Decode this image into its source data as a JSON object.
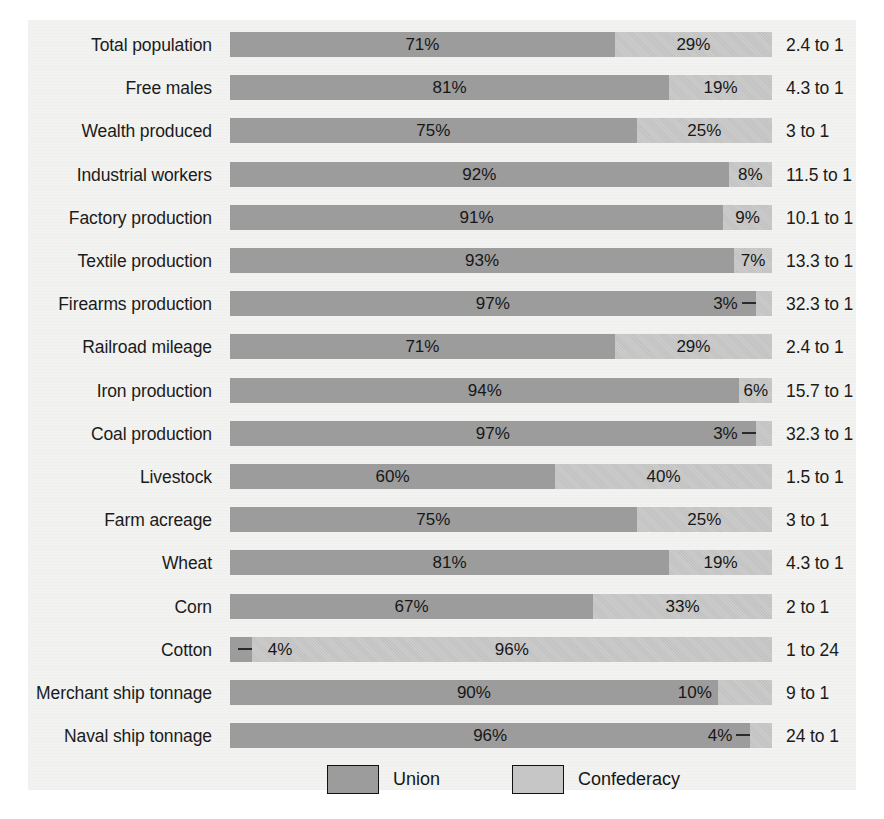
{
  "chart_data": {
    "type": "bar",
    "subtype": "stacked-horizontal-100pct",
    "title": "",
    "xlabel": "",
    "ylabel": "",
    "xlim": [
      0,
      100
    ],
    "grid": false,
    "legend_position": "bottom",
    "categories": [
      "Total population",
      "Free males",
      "Wealth produced",
      "Industrial workers",
      "Factory production",
      "Textile production",
      "Firearms production",
      "Railroad mileage",
      "Iron production",
      "Coal production",
      "Livestock",
      "Farm acreage",
      "Wheat",
      "Corn",
      "Cotton",
      "Merchant ship tonnage",
      "Naval ship tonnage"
    ],
    "series": [
      {
        "name": "Union",
        "color": "#9c9c9c",
        "values": [
          71,
          81,
          75,
          92,
          91,
          93,
          97,
          71,
          94,
          97,
          60,
          75,
          81,
          67,
          4,
          90,
          96
        ]
      },
      {
        "name": "Confederacy",
        "color": "#c6c6c6",
        "values": [
          29,
          19,
          25,
          8,
          9,
          7,
          3,
          29,
          6,
          3,
          40,
          25,
          19,
          33,
          96,
          10,
          4
        ]
      }
    ],
    "annotations": {
      "ratio_label": "to 1 ratio (Union : Confederacy) shown at right of each bar"
    }
  },
  "rows": [
    {
      "label": "Total population",
      "union_pct": 71,
      "conf_pct": 29,
      "union_text": "71%",
      "conf_text": "29%",
      "ratio": "2.4 to 1",
      "union_label_pos": "center",
      "conf_label_pos": "center",
      "leader": "none"
    },
    {
      "label": "Free males",
      "union_pct": 81,
      "conf_pct": 19,
      "union_text": "81%",
      "conf_text": "19%",
      "ratio": "4.3 to 1",
      "union_label_pos": "center",
      "conf_label_pos": "center",
      "leader": "none"
    },
    {
      "label": "Wealth produced",
      "union_pct": 75,
      "conf_pct": 25,
      "union_text": "75%",
      "conf_text": "25%",
      "ratio": "3 to 1",
      "union_label_pos": "center",
      "conf_label_pos": "center",
      "leader": "none"
    },
    {
      "label": "Industrial workers",
      "union_pct": 92,
      "conf_pct": 8,
      "union_text": "92%",
      "conf_text": "8%",
      "ratio": "11.5 to 1",
      "union_label_pos": "center",
      "conf_label_pos": "center",
      "leader": "none"
    },
    {
      "label": "Factory production",
      "union_pct": 91,
      "conf_pct": 9,
      "union_text": "91%",
      "conf_text": "9%",
      "ratio": "10.1 to 1",
      "union_label_pos": "center",
      "conf_label_pos": "center",
      "leader": "none"
    },
    {
      "label": "Textile production",
      "union_pct": 93,
      "conf_pct": 7,
      "union_text": "93%",
      "conf_text": "7%",
      "ratio": "13.3 to 1",
      "union_label_pos": "center",
      "conf_label_pos": "center",
      "leader": "none"
    },
    {
      "label": "Firearms production",
      "union_pct": 97,
      "conf_pct": 3,
      "union_text": "97%",
      "conf_text": "3%",
      "ratio": "32.3 to 1",
      "union_label_pos": "center",
      "conf_label_pos": "inside-union-right",
      "leader": "right"
    },
    {
      "label": "Railroad mileage",
      "union_pct": 71,
      "conf_pct": 29,
      "union_text": "71%",
      "conf_text": "29%",
      "ratio": "2.4 to 1",
      "union_label_pos": "center",
      "conf_label_pos": "center",
      "leader": "none"
    },
    {
      "label": "Iron production",
      "union_pct": 94,
      "conf_pct": 6,
      "union_text": "94%",
      "conf_text": "6%",
      "ratio": "15.7 to 1",
      "union_label_pos": "center",
      "conf_label_pos": "center",
      "leader": "none"
    },
    {
      "label": "Coal production",
      "union_pct": 97,
      "conf_pct": 3,
      "union_text": "97%",
      "conf_text": "3%",
      "ratio": "32.3 to 1",
      "union_label_pos": "center",
      "conf_label_pos": "inside-union-right",
      "leader": "right"
    },
    {
      "label": "Livestock",
      "union_pct": 60,
      "conf_pct": 40,
      "union_text": "60%",
      "conf_text": "40%",
      "ratio": "1.5 to 1",
      "union_label_pos": "center",
      "conf_label_pos": "center",
      "leader": "none"
    },
    {
      "label": "Farm acreage",
      "union_pct": 75,
      "conf_pct": 25,
      "union_text": "75%",
      "conf_text": "25%",
      "ratio": "3 to 1",
      "union_label_pos": "center",
      "conf_label_pos": "center",
      "leader": "none"
    },
    {
      "label": "Wheat",
      "union_pct": 81,
      "conf_pct": 19,
      "union_text": "81%",
      "conf_text": "19%",
      "ratio": "4.3 to 1",
      "union_label_pos": "center",
      "conf_label_pos": "center",
      "leader": "none"
    },
    {
      "label": "Corn",
      "union_pct": 67,
      "conf_pct": 33,
      "union_text": "67%",
      "conf_text": "33%",
      "ratio": "2 to 1",
      "union_label_pos": "center",
      "conf_label_pos": "center",
      "leader": "none"
    },
    {
      "label": "Cotton",
      "union_pct": 4,
      "conf_pct": 96,
      "union_text": "4%",
      "conf_text": "96%",
      "ratio": "1 to 24",
      "union_label_pos": "inside-conf-left",
      "conf_label_pos": "center",
      "leader": "left"
    },
    {
      "label": "Merchant ship tonnage",
      "union_pct": 90,
      "conf_pct": 10,
      "union_text": "90%",
      "conf_text": "10%",
      "ratio": "9 to 1",
      "union_label_pos": "center",
      "conf_label_pos": "inside-union-right",
      "leader": "none"
    },
    {
      "label": "Naval ship tonnage",
      "union_pct": 96,
      "conf_pct": 4,
      "union_text": "96%",
      "conf_text": "4%",
      "ratio": "24 to 1",
      "union_label_pos": "center",
      "conf_label_pos": "inside-union-right",
      "leader": "right"
    }
  ],
  "legend": {
    "items": [
      {
        "label": "Union",
        "color": "#9c9c9c"
      },
      {
        "label": "Confederacy",
        "color": "#c6c6c6"
      }
    ]
  },
  "layout": {
    "bar_left": 230,
    "bar_width": 542,
    "row_top": 32,
    "row_pitch": 43.2,
    "bar_height": 25,
    "ratio_left": 786,
    "legend_item_lefts": [
      327,
      512
    ]
  }
}
